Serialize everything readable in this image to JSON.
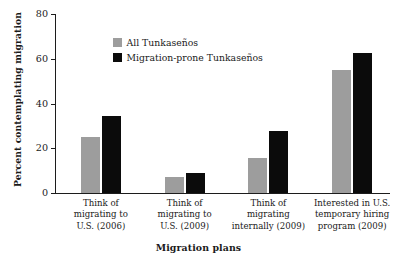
{
  "chart_data": {
    "type": "bar",
    "title": "",
    "xlabel": "Migration plans",
    "ylabel": "Percent contemplating migration",
    "ylim": [
      0,
      80
    ],
    "yticks": [
      0,
      20,
      40,
      60,
      80
    ],
    "grid": false,
    "legend_position": "upper-center-left",
    "categories": [
      "Think of migrating to U.S. (2006)",
      "Think of migrating to U.S. (2009)",
      "Think of migrating internally (2009)",
      "Interested in U.S. temporary hiring program (2009)"
    ],
    "category_lines": [
      [
        "Think of",
        "migrating to",
        "U.S. (2006)"
      ],
      [
        "Think of",
        "migrating to",
        "U.S. (2009)"
      ],
      [
        "Think of",
        "migrating",
        "internally (2009)"
      ],
      [
        "Interested in U.S.",
        "temporary hiring",
        "program (2009)"
      ]
    ],
    "series": [
      {
        "name": "All Tunkaseños",
        "color": "#9d9d9d",
        "values": [
          25,
          7,
          15.5,
          55
        ]
      },
      {
        "name": "Migration-prone Tunkaseños",
        "color": "#0b0b0b",
        "values": [
          34.5,
          9,
          27.5,
          62.5
        ]
      }
    ]
  }
}
